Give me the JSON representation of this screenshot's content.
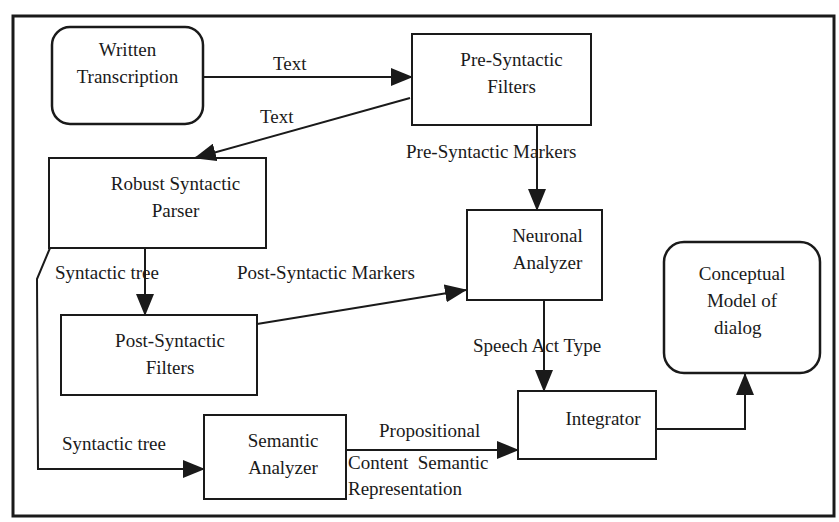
{
  "colors": {
    "stroke": "#1a1a1a",
    "background": "#ffffff"
  },
  "nodes": {
    "written_transcription": {
      "lines": [
        "Written",
        "Transcription"
      ],
      "shape": "rounded"
    },
    "pre_syntactic_filters": {
      "lines": [
        "Pre-Syntactic",
        "Filters"
      ],
      "shape": "rect"
    },
    "robust_syntactic_parser": {
      "lines": [
        "Robust Syntactic",
        "Parser"
      ],
      "shape": "rect"
    },
    "neuronal_analyzer": {
      "lines": [
        "Neuronal",
        "Analyzer"
      ],
      "shape": "rect"
    },
    "conceptual_model": {
      "lines": [
        "Conceptual",
        "Model of",
        "dialog"
      ],
      "shape": "rounded"
    },
    "post_syntactic_filters": {
      "lines": [
        "Post-Syntactic",
        "Filters"
      ],
      "shape": "rect"
    },
    "semantic_analyzer": {
      "lines": [
        "Semantic",
        "Analyzer"
      ],
      "shape": "rect"
    },
    "integrator": {
      "lines": [
        "Integrator"
      ],
      "shape": "rect"
    }
  },
  "edges": {
    "text_1": "Text",
    "text_2": "Text",
    "pre_syntactic_markers": "Pre-Syntactic Markers",
    "syntactic_tree_1": "Syntactic tree",
    "post_syntactic_markers": "Post-Syntactic Markers",
    "speech_act_type": "Speech Act Type",
    "syntactic_tree_2": "Syntactic tree",
    "propositional": "Propositional",
    "content_semantic": "Content  Semantic",
    "representation": "Representation"
  }
}
